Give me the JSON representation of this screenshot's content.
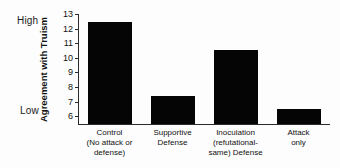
{
  "anchors": {
    "high": "High",
    "low": "Low"
  },
  "axis": {
    "y_title": "Agreement with Truism",
    "tick_labels": [
      "13",
      "12",
      "11",
      "10",
      "9",
      "8",
      "7",
      "6"
    ]
  },
  "chart_data": {
    "type": "bar",
    "title": "",
    "subtitle": "",
    "xlabel": "",
    "ylabel": "Agreement with Truism",
    "ylim": [
      5.4,
      13.0
    ],
    "yticks": [
      6,
      7,
      8,
      9,
      10,
      11,
      12,
      13
    ],
    "grid": false,
    "legend": null,
    "bar_color": "#050505",
    "categories": [
      "Control\n(No attack or\ndefense)",
      "Supportive\nDefense",
      "Inoculation\n(refutational-\nsame) Defense",
      "Attack\nonly"
    ],
    "category_lines": [
      [
        "Control",
        "(No attack or",
        "defense)"
      ],
      [
        "Supportive",
        "Defense"
      ],
      [
        "Inoculation",
        "(refutational-",
        "same) Defense"
      ],
      [
        "Attack",
        "only"
      ]
    ],
    "values": [
      12.4,
      7.3,
      10.5,
      6.4
    ],
    "annotations": [
      {
        "text": "High",
        "position": "y-axis-top-anchor"
      },
      {
        "text": "Low",
        "position": "y-axis-bottom-anchor"
      }
    ]
  }
}
